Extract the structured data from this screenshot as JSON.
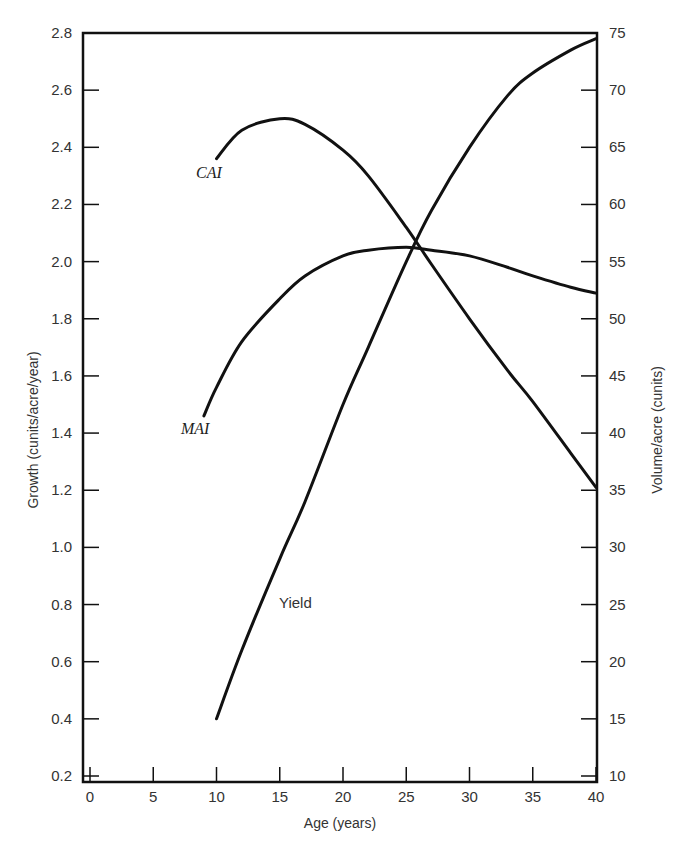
{
  "chart_data": {
    "type": "line",
    "title": "",
    "xlabel": "Age (years)",
    "ylabel": "Growth (cunits/acre/year)",
    "y2label": "Volume/acre (cunits)",
    "xlim": [
      0,
      40
    ],
    "ylim": [
      0.2,
      2.8
    ],
    "y2lim": [
      10,
      75
    ],
    "grid": false,
    "legend": "none (curves labeled directly)",
    "x_ticks": [
      "0",
      "5",
      "10",
      "15",
      "20",
      "25",
      "30",
      "35",
      "40"
    ],
    "y_ticks": [
      "0.2",
      "0.4",
      "0.6",
      "0.8",
      "1.0",
      "1.2",
      "1.4",
      "1.6",
      "1.8",
      "2.0",
      "2.2",
      "2.4",
      "2.6",
      "2.8"
    ],
    "y2_ticks": [
      "10",
      "15",
      "20",
      "25",
      "30",
      "35",
      "40",
      "45",
      "50",
      "55",
      "60",
      "65",
      "70",
      "75"
    ],
    "series": [
      {
        "name": "CAI",
        "axis": "left",
        "x": [
          10,
          12,
          15,
          17,
          20,
          22,
          25,
          27,
          30,
          33,
          35,
          38,
          40
        ],
        "values": [
          2.36,
          2.46,
          2.5,
          2.48,
          2.39,
          2.3,
          2.12,
          1.99,
          1.8,
          1.62,
          1.51,
          1.33,
          1.21
        ]
      },
      {
        "name": "MAI",
        "axis": "left",
        "x": [
          9,
          10,
          12,
          15,
          17,
          20,
          22,
          25,
          27,
          30,
          33,
          35,
          38,
          40
        ],
        "values": [
          1.46,
          1.56,
          1.72,
          1.87,
          1.95,
          2.02,
          2.04,
          2.05,
          2.04,
          2.02,
          1.98,
          1.95,
          1.91,
          1.89
        ]
      },
      {
        "name": "Yield",
        "axis": "right",
        "x": [
          10,
          12,
          15,
          17,
          20,
          22,
          25,
          27,
          30,
          33,
          35,
          38,
          40
        ],
        "values": [
          15,
          21,
          29,
          34,
          42.5,
          47.5,
          55,
          59.5,
          65,
          69.5,
          71.5,
          73.5,
          74.5
        ]
      }
    ],
    "annotations": [
      {
        "text": "CAI",
        "near_x": 10,
        "near_y": 2.3
      },
      {
        "text": "MAI",
        "near_x": 9,
        "near_y": 1.4
      },
      {
        "text": "Yield",
        "near_x": 16,
        "near_y_right": 25.5
      }
    ]
  },
  "labels": {
    "cai": "CAI",
    "mai": "MAI",
    "yield": "Yield",
    "xlabel": "Age (years)",
    "ylabel": "Growth (cunits/acre/year)",
    "y2label": "Volume/acre (cunits)"
  },
  "colors": {
    "line": "#111111",
    "text": "#333333",
    "background": "#ffffff"
  }
}
